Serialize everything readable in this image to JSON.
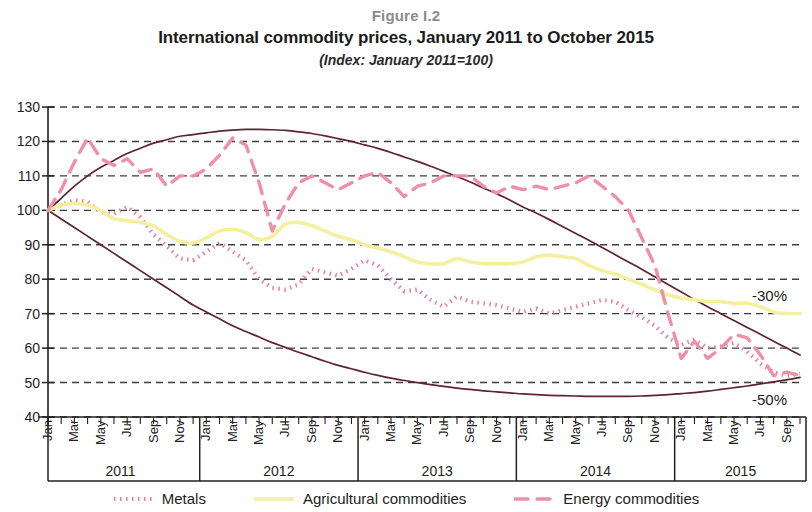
{
  "figure": {
    "number": "Figure I.2",
    "title": "International commodity prices, January 2011 to October 2015",
    "subtitle": "(Index: January 2011=100)"
  },
  "colors": {
    "metals": "#e8809f",
    "agricultural": "#f4f0a0",
    "energy": "#ef8fa8",
    "envelope": "#5d2433",
    "grid": "#3f3f3f",
    "axis": "#231f20",
    "figure_number": "#8c8c8c"
  },
  "legend": {
    "items": [
      {
        "label": "Metals",
        "key": "metals",
        "style": "dotted"
      },
      {
        "label": "Agricultural commodities",
        "key": "agricultural",
        "style": "solid"
      },
      {
        "label": "Energy commodities",
        "key": "energy",
        "style": "dashed"
      }
    ]
  },
  "annotations": [
    {
      "text": "-30%",
      "x": 752,
      "y": 288
    },
    {
      "text": "-50%",
      "x": 752,
      "y": 392
    }
  ],
  "years": [
    {
      "label": "2011",
      "start_index": 0,
      "end_index": 11
    },
    {
      "label": "2012",
      "start_index": 12,
      "end_index": 23
    },
    {
      "label": "2013",
      "start_index": 24,
      "end_index": 35
    },
    {
      "label": "2014",
      "start_index": 36,
      "end_index": 47
    },
    {
      "label": "2015",
      "start_index": 48,
      "end_index": 57
    }
  ],
  "chart_data": {
    "type": "line",
    "title": "International commodity prices, January 2011 to October 2015",
    "subtitle": "(Index: January 2011=100)",
    "xlabel": "",
    "ylabel": "",
    "ylim": [
      40,
      130
    ],
    "yticks": [
      40,
      50,
      60,
      70,
      80,
      90,
      100,
      110,
      120,
      130
    ],
    "grid": true,
    "legend_position": "bottom",
    "x_tick_labels": [
      "Jan",
      "Mar",
      "May",
      "Jul",
      "Sep",
      "Nov"
    ],
    "x_tick_month_indices_per_year": [
      0,
      2,
      4,
      6,
      8,
      10
    ],
    "x": [
      "Jan 2011",
      "Feb 2011",
      "Mar 2011",
      "Apr 2011",
      "May 2011",
      "Jun 2011",
      "Jul 2011",
      "Aug 2011",
      "Sep 2011",
      "Oct 2011",
      "Nov 2011",
      "Dec 2011",
      "Jan 2012",
      "Feb 2012",
      "Mar 2012",
      "Apr 2012",
      "May 2012",
      "Jun 2012",
      "Jul 2012",
      "Aug 2012",
      "Sep 2012",
      "Oct 2012",
      "Nov 2012",
      "Dec 2012",
      "Jan 2013",
      "Feb 2013",
      "Mar 2013",
      "Apr 2013",
      "May 2013",
      "Jun 2013",
      "Jul 2013",
      "Aug 2013",
      "Sep 2013",
      "Oct 2013",
      "Nov 2013",
      "Dec 2013",
      "Jan 2014",
      "Feb 2014",
      "Mar 2014",
      "Apr 2014",
      "May 2014",
      "Jun 2014",
      "Jul 2014",
      "Aug 2014",
      "Sep 2014",
      "Oct 2014",
      "Nov 2014",
      "Dec 2014",
      "Jan 2015",
      "Feb 2015",
      "Mar 2015",
      "Apr 2015",
      "May 2015",
      "Jun 2015",
      "Jul 2015",
      "Aug 2015",
      "Sep 2015",
      "Oct 2015"
    ],
    "series": [
      {
        "name": "Metals",
        "key": "metals",
        "style": "dotted",
        "color": "#e8809f",
        "values": [
          100,
          101.5,
          103,
          102.5,
          99.5,
          99,
          101,
          98,
          93,
          89.5,
          86,
          85.5,
          88,
          90.5,
          88,
          85.5,
          80,
          77.5,
          77,
          78.5,
          83,
          82,
          81,
          83,
          85.5,
          84,
          80,
          76.5,
          77,
          74,
          72,
          75,
          73.5,
          73,
          72.5,
          71.5,
          70.5,
          71.5,
          70,
          71,
          72,
          73,
          74,
          73.5,
          71,
          69,
          66.5,
          63,
          61,
          62.5,
          60,
          60.5,
          61.5,
          59,
          55.5,
          53,
          52,
          52.5
        ]
      },
      {
        "name": "Agricultural commodities",
        "key": "agricultural",
        "style": "solid",
        "color": "#f4f0a0",
        "values": [
          100,
          101.5,
          102,
          101.5,
          100,
          97.5,
          97,
          96.5,
          95.5,
          93,
          91,
          90.5,
          92,
          94,
          94.5,
          93.5,
          91.5,
          92.5,
          96,
          96.5,
          95.5,
          94,
          92.5,
          91.5,
          90,
          89,
          88,
          86.5,
          85,
          84.5,
          84.5,
          86,
          85,
          84.5,
          84.5,
          84.5,
          85,
          86.5,
          87,
          86.5,
          86,
          84,
          82.5,
          81.5,
          80,
          78.5,
          77,
          75.5,
          74.5,
          74,
          73.5,
          73.5,
          73,
          73,
          72,
          70.5,
          70,
          70
        ]
      },
      {
        "name": "Energy commodities",
        "key": "energy",
        "style": "dashed",
        "color": "#ef8fa8",
        "values": [
          100,
          106,
          114,
          121,
          115,
          113,
          115,
          111,
          112,
          107,
          110,
          110,
          112,
          116,
          121,
          119,
          108,
          94,
          102,
          108,
          110,
          108,
          106,
          108,
          110,
          111,
          108,
          104,
          107,
          108,
          110,
          110,
          110,
          107,
          105,
          107,
          106,
          107,
          106,
          107,
          108,
          110,
          107,
          104,
          100,
          92,
          84,
          70,
          57,
          62,
          57,
          60,
          64,
          63,
          58,
          52,
          53,
          52
        ]
      }
    ],
    "envelope_upper": {
      "name": "-30% envelope",
      "color": "#5d2433",
      "values": [
        100,
        103.5,
        107,
        110,
        112.5,
        114.5,
        116.5,
        118,
        119.5,
        120.5,
        121.5,
        122,
        122.5,
        123,
        123.3,
        123.5,
        123.5,
        123.4,
        123.2,
        122.8,
        122.3,
        121.6,
        120.8,
        120,
        119,
        118,
        116.8,
        115.5,
        114.2,
        112.8,
        111.3,
        109.8,
        108.2,
        106.5,
        104.8,
        103,
        101,
        99.2,
        97.3,
        95.3,
        93.3,
        91.3,
        89.2,
        87.1,
        85,
        82.9,
        80.7,
        78.5,
        76.3,
        74.1,
        72,
        70,
        68,
        66,
        64,
        62,
        60,
        58
      ],
      "end_label": "-30%"
    },
    "envelope_lower": {
      "name": "-50% envelope",
      "color": "#5d2433",
      "values": [
        100,
        97.5,
        95,
        92.5,
        90,
        87.5,
        85,
        82.5,
        80,
        77.5,
        75,
        72.5,
        70.5,
        68.5,
        66.5,
        64.8,
        63.2,
        61.6,
        60.2,
        58.8,
        57.5,
        56.2,
        55,
        54,
        53,
        52.1,
        51.3,
        50.6,
        50,
        49.4,
        48.9,
        48.4,
        48,
        47.6,
        47.3,
        47,
        46.7,
        46.5,
        46.3,
        46.2,
        46.1,
        46,
        46,
        46,
        46,
        46.1,
        46.3,
        46.5,
        46.8,
        47.1,
        47.5,
        48,
        48.5,
        49,
        49.6,
        50.2,
        50.8,
        51.5
      ],
      "end_label": "-50%"
    }
  }
}
